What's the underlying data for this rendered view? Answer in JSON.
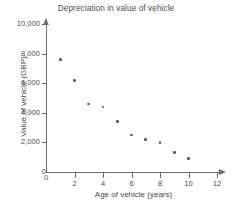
{
  "chart_data": {
    "type": "scatter",
    "title": "Depreciation in value of vehicle",
    "xlabel": "Age of vehicle (years)",
    "ylabel": "Value of vehicle (GBP)",
    "x": [
      1,
      2,
      3,
      4,
      5,
      6,
      7,
      8,
      9,
      10
    ],
    "values": [
      7600,
      6200,
      4600,
      4400,
      3400,
      2500,
      2200,
      2000,
      1300,
      900
    ],
    "points": [
      {
        "x": 1,
        "y": 7600
      },
      {
        "x": 2,
        "y": 6200
      },
      {
        "x": 3,
        "y": 4600
      },
      {
        "x": 4,
        "y": 4400
      },
      {
        "x": 5,
        "y": 3400
      },
      {
        "x": 6,
        "y": 2500
      },
      {
        "x": 7,
        "y": 2200
      },
      {
        "x": 8,
        "y": 2000
      },
      {
        "x": 9,
        "y": 1300
      },
      {
        "x": 10,
        "y": 900
      }
    ],
    "xlim": [
      0,
      12
    ],
    "ylim": [
      0,
      10000
    ],
    "xticks": [
      0,
      2,
      4,
      6,
      8,
      10,
      12
    ],
    "xtick_labels": [
      "0",
      "2",
      "4",
      "6",
      "8",
      "10",
      "12"
    ],
    "yticks": [
      0,
      2000,
      4000,
      6000,
      8000,
      10000
    ],
    "ytick_labels": [
      "0",
      "2,000",
      "4,000",
      "6,000",
      "8,000",
      "10,000"
    ],
    "grid": false,
    "legend": null,
    "marker_color": "#5a5a5a",
    "axis_color": "#6d6d6d",
    "text_color": "#4a4a4a",
    "background": "#ffffff"
  }
}
